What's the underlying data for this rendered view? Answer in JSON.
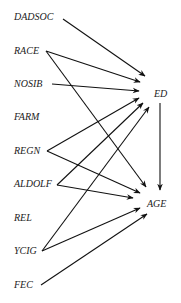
{
  "diagram": {
    "type": "directed-graph",
    "nodes": [
      {
        "id": "DADSOC",
        "label": "DADSOC",
        "x": 14,
        "y": 20
      },
      {
        "id": "RACE",
        "label": "RACE",
        "x": 14,
        "y": 54
      },
      {
        "id": "NOSIB",
        "label": "NOSIB",
        "x": 14,
        "y": 87
      },
      {
        "id": "FARM",
        "label": "FARM",
        "x": 14,
        "y": 120
      },
      {
        "id": "REGN",
        "label": "REGN",
        "x": 14,
        "y": 154
      },
      {
        "id": "ALDOLF",
        "label": "ALDOLF",
        "x": 14,
        "y": 187
      },
      {
        "id": "REL",
        "label": "REL",
        "x": 14,
        "y": 221
      },
      {
        "id": "YCIG",
        "label": "YCIG",
        "x": 14,
        "y": 254
      },
      {
        "id": "FEC",
        "label": "FEC",
        "x": 14,
        "y": 288
      },
      {
        "id": "ED",
        "label": "ED",
        "x": 154,
        "y": 97
      },
      {
        "id": "AGE",
        "label": "AGE",
        "x": 147,
        "y": 207
      }
    ],
    "edges": [
      {
        "from": "DADSOC",
        "to": "ED",
        "x1": 63,
        "y1": 19,
        "x2": 145,
        "y2": 76
      },
      {
        "from": "RACE",
        "to": "ED",
        "x1": 46,
        "y1": 51,
        "x2": 140,
        "y2": 82
      },
      {
        "from": "RACE",
        "to": "AGE",
        "x1": 46,
        "y1": 51,
        "x2": 146,
        "y2": 187
      },
      {
        "from": "NOSIB",
        "to": "ED",
        "x1": 52,
        "y1": 84,
        "x2": 139,
        "y2": 91
      },
      {
        "from": "REGN",
        "to": "ED",
        "x1": 47,
        "y1": 151,
        "x2": 139,
        "y2": 98
      },
      {
        "from": "REGN",
        "to": "AGE",
        "x1": 47,
        "y1": 151,
        "x2": 140,
        "y2": 193
      },
      {
        "from": "ALDOLF",
        "to": "ED",
        "x1": 57,
        "y1": 185,
        "x2": 143,
        "y2": 103
      },
      {
        "from": "ALDOLF",
        "to": "AGE",
        "x1": 57,
        "y1": 185,
        "x2": 133,
        "y2": 198
      },
      {
        "from": "YCIG",
        "to": "ED",
        "x1": 42,
        "y1": 251,
        "x2": 149,
        "y2": 107
      },
      {
        "from": "YCIG",
        "to": "AGE",
        "x1": 42,
        "y1": 251,
        "x2": 140,
        "y2": 208
      },
      {
        "from": "FEC",
        "to": "AGE",
        "x1": 41,
        "y1": 285,
        "x2": 147,
        "y2": 214
      },
      {
        "from": "ED",
        "to": "AGE",
        "x1": 160,
        "y1": 103,
        "x2": 160,
        "y2": 190
      }
    ]
  }
}
